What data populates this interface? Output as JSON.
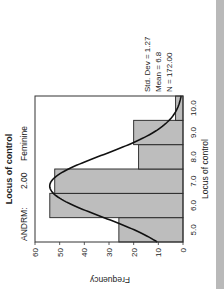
{
  "chart_data": {
    "type": "bar",
    "orientation": "rotated -90deg (histogram printed sideways)",
    "title": "Locus of control",
    "subtitle": {
      "label": "ANDRM:",
      "value": "2.00",
      "group": "Feminine"
    },
    "xlabel": "Locus of control",
    "ylabel": "Frequency",
    "categories": [
      "5.0",
      "6.0",
      "7.0",
      "8.0",
      "9.0",
      "10.0"
    ],
    "values": [
      26,
      54,
      52,
      18,
      20,
      3
    ],
    "ylim": [
      0,
      60
    ],
    "yticks": [
      "0",
      "10",
      "20",
      "30",
      "40",
      "50",
      "60"
    ],
    "grid": false,
    "overlay": {
      "type": "normal-curve",
      "mean": 6.8,
      "std_dev": 1.27,
      "n": 172
    },
    "stats": {
      "std_dev": "Std. Dev = 1.27",
      "mean": "Mean = 6.8",
      "n": "N = 172.00"
    },
    "legend": null
  },
  "colors": {
    "bar_fill": "#bdbdbd",
    "bar_stroke": "#222222",
    "curve": "#111111",
    "frame": "#333333",
    "strip": "#b9b9b9"
  }
}
